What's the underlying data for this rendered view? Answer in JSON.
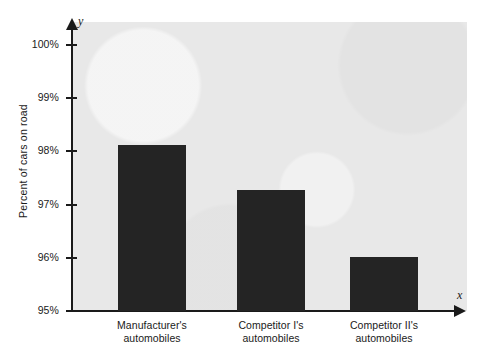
{
  "chart_data": {
    "type": "bar",
    "title": "",
    "subtitle": "",
    "xlabel": "",
    "ylabel": "Percent of cars on road",
    "x_axis_variable": "x",
    "y_axis_variable": "y",
    "categories": [
      "Manufacturer's automobiles",
      "Competitor I's automobiles",
      "Competitor II's automobiles"
    ],
    "category_lines": [
      [
        "Manufacturer's",
        "automobiles"
      ],
      [
        "Competitor I's",
        "automobiles"
      ],
      [
        "Competitor II's",
        "automobiles"
      ]
    ],
    "values": [
      98.12,
      97.28,
      96.02
    ],
    "value_labels": [
      "98.1%",
      "97.3%",
      "96.0%"
    ],
    "ylim": [
      95,
      100
    ],
    "y_ticks": [
      95,
      96,
      97,
      98,
      99,
      100
    ],
    "y_tick_labels": [
      "95%",
      "96%",
      "97%",
      "98%",
      "99%",
      "100%"
    ],
    "grid": false,
    "legend": false,
    "legend_position": "none",
    "bar_color": "#242424",
    "plot_background_color": "#e8e8e8",
    "figure_background_color": "#ffffff",
    "axis_color": "#1a1a1a"
  },
  "axis": {
    "y_variable_label": "y",
    "x_variable_label": "x"
  }
}
